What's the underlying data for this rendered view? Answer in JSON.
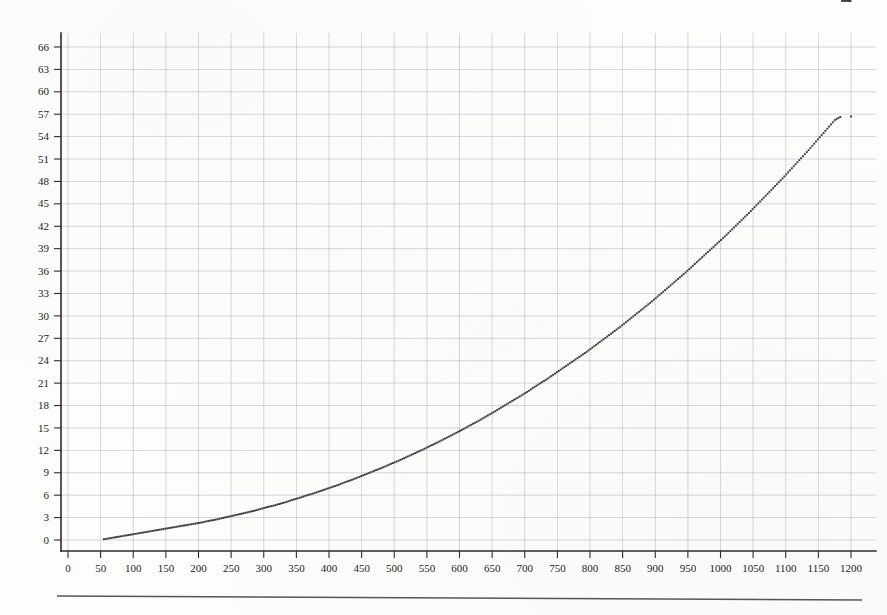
{
  "page": {
    "title": "",
    "background_color": "#fdfdfc",
    "rule_color": "#3a3a3a"
  },
  "chart_data": {
    "type": "scatter",
    "title": "",
    "subtitle": "",
    "xlabel": "",
    "ylabel": "",
    "xlim": [
      0,
      1220
    ],
    "ylim": [
      -1.5,
      68
    ],
    "grid": true,
    "legend": null,
    "marker": "square-dot",
    "marker_color": "#3b3b3f",
    "marker_size": 1.9,
    "gridline_color": "#b9bcc4",
    "axis_color": "#2b2b2b",
    "x_ticks": [
      0,
      50,
      100,
      150,
      200,
      250,
      300,
      350,
      400,
      450,
      500,
      550,
      600,
      650,
      700,
      750,
      800,
      850,
      900,
      950,
      1000,
      1050,
      1100,
      1150,
      1200
    ],
    "x_tick_labels": [
      "0",
      "50",
      "100",
      "150",
      "200",
      "250",
      "300",
      "350",
      "400",
      "450",
      "500",
      "550",
      "600",
      "650",
      "700",
      "750",
      "800",
      "850",
      "900",
      "950",
      "1000",
      "1050",
      "1100",
      "1150",
      "1200"
    ],
    "y_ticks": [
      0,
      3,
      6,
      9,
      12,
      15,
      18,
      21,
      24,
      27,
      30,
      33,
      36,
      39,
      42,
      45,
      48,
      51,
      54,
      57,
      60,
      63,
      66
    ],
    "y_tick_labels": [
      "0",
      "3",
      "6",
      "9",
      "12",
      "15",
      "18",
      "21",
      "24",
      "27",
      "30",
      "33",
      "36",
      "39",
      "42",
      "45",
      "48",
      "51",
      "54",
      "57",
      "60",
      "63",
      "66"
    ],
    "x": [
      55,
      65,
      75,
      85,
      95,
      105,
      115,
      125,
      135,
      145,
      155,
      165,
      175,
      185,
      195,
      205,
      215,
      225,
      235,
      245,
      255,
      265,
      275,
      285,
      295,
      305,
      315,
      325,
      335,
      345,
      355,
      365,
      375,
      385,
      395,
      405,
      415,
      425,
      435,
      445,
      455,
      465,
      475,
      485,
      495,
      505,
      515,
      525,
      535,
      545,
      555,
      565,
      575,
      585,
      595,
      605,
      615,
      625,
      635,
      645,
      655,
      665,
      675,
      685,
      695,
      705,
      715,
      725,
      735,
      745,
      755,
      765,
      775,
      785,
      795,
      805,
      815,
      825,
      835,
      845,
      855,
      865,
      875,
      885,
      895,
      905,
      915,
      925,
      935,
      945,
      955,
      965,
      975,
      985,
      995,
      1005,
      1015,
      1025,
      1035,
      1045,
      1055,
      1065,
      1075,
      1085,
      1095,
      1105,
      1115,
      1125,
      1135,
      1145,
      1155,
      1165,
      1175,
      1185,
      1195,
      1200
    ],
    "y": [
      0.1,
      0.25,
      0.4,
      0.55,
      0.7,
      0.85,
      1.0,
      1.15,
      1.3,
      1.45,
      1.6,
      1.75,
      1.9,
      2.05,
      2.2,
      2.35,
      2.55,
      2.7,
      2.9,
      3.1,
      3.3,
      3.5,
      3.7,
      3.9,
      4.15,
      4.4,
      4.6,
      4.85,
      5.1,
      5.4,
      5.65,
      5.95,
      6.2,
      6.5,
      6.8,
      7.1,
      7.4,
      7.75,
      8.05,
      8.4,
      8.75,
      9.1,
      9.45,
      9.8,
      10.2,
      10.55,
      10.95,
      11.35,
      11.75,
      12.15,
      12.6,
      13.0,
      13.45,
      13.9,
      14.35,
      14.8,
      15.3,
      15.75,
      16.25,
      16.75,
      17.25,
      17.8,
      18.3,
      18.85,
      19.35,
      19.9,
      20.5,
      21.05,
      21.6,
      22.2,
      22.8,
      23.4,
      24.0,
      24.6,
      25.2,
      25.85,
      26.5,
      27.15,
      27.8,
      28.45,
      29.15,
      29.85,
      30.55,
      31.25,
      31.95,
      32.7,
      33.45,
      34.2,
      34.95,
      35.7,
      36.5,
      37.3,
      38.1,
      38.9,
      39.7,
      40.5,
      41.35,
      42.2,
      43.05,
      43.9,
      44.8,
      45.7,
      46.6,
      47.5,
      48.4,
      49.35,
      50.3,
      51.25,
      52.2,
      53.2,
      54.2,
      55.2,
      56.2,
      56.7
    ]
  },
  "axes": {
    "x_axis_name": "x-axis",
    "y_axis_name": "y-axis"
  }
}
